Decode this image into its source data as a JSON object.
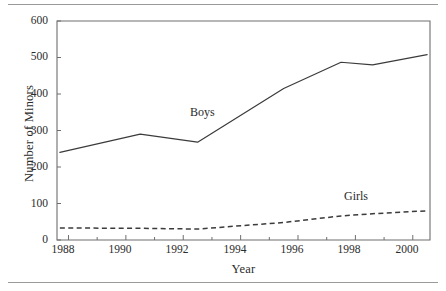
{
  "chart_data": {
    "type": "line",
    "title": "",
    "xlabel": "Year",
    "ylabel": "Number of Minors",
    "xlim": [
      1987.6,
      2000.6
    ],
    "ylim": [
      0,
      600
    ],
    "grid": false,
    "legend_position": "inline-annotation",
    "x_major_ticks": [
      1988,
      1990,
      1992,
      1994,
      1996,
      1998,
      2000
    ],
    "x_major_tick_labels": [
      "1988",
      "1990",
      "1992",
      "1994",
      "1996",
      "1998",
      "2000"
    ],
    "x_minor_ticks": [
      1989,
      1991,
      1993,
      1995,
      1997,
      1999
    ],
    "y_ticks": [
      0,
      100,
      200,
      300,
      400,
      500,
      600
    ],
    "y_tick_labels": [
      "0",
      "100",
      "200",
      "300",
      "400",
      "500",
      "600"
    ],
    "x": [
      1987.7,
      1990.5,
      1992.5,
      1995.5,
      1997.5,
      1998.6,
      2000.5
    ],
    "series": [
      {
        "name": "Boys",
        "style": "solid",
        "color": "#3b3b3b",
        "x": [
          1987.7,
          1990.5,
          1992.5,
          1995.5,
          1997.5,
          1998.6,
          2000.5
        ],
        "values": [
          240,
          290,
          268,
          415,
          487,
          480,
          508
        ],
        "label_text": "Boys"
      },
      {
        "name": "Girls",
        "style": "dashed",
        "color": "#3b3b3b",
        "x": [
          1987.7,
          1990.5,
          1992.5,
          1995.5,
          1997.5,
          1998.6,
          2000.5
        ],
        "values": [
          33,
          32,
          30,
          48,
          66,
          72,
          80
        ],
        "label_text": "Girls"
      }
    ],
    "annotations": [
      {
        "text": "Boys",
        "x": 1992.0,
        "y": 340
      },
      {
        "text": "Girls",
        "x": 1997.3,
        "y": 118
      }
    ]
  },
  "figure": {
    "ylabel": "Number of Minors",
    "xlabel": "Year",
    "ytick_0": "0",
    "ytick_100": "100",
    "ytick_200": "200",
    "ytick_300": "300",
    "ytick_400": "400",
    "ytick_500": "500",
    "ytick_600": "600",
    "xtick_1988": "1988",
    "xtick_1990": "1990",
    "xtick_1992": "1992",
    "xtick_1994": "1994",
    "xtick_1996": "1996",
    "xtick_1998": "1998",
    "xtick_2000": "2000",
    "label_boys": "Boys",
    "label_girls": "Girls"
  }
}
